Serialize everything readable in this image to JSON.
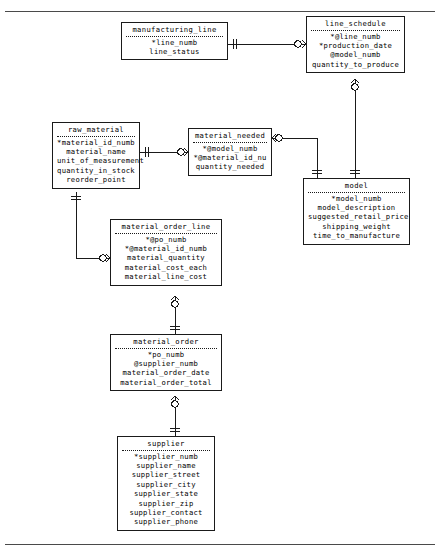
{
  "diagram": {
    "notation": "crow's foot (IE) notation",
    "legend": {
      "primary_key_marker": "*",
      "foreign_key_marker": "@"
    },
    "entities": [
      {
        "id": "manufacturing_line",
        "name": "manufacturing_line",
        "attributes": [
          "*line_numb",
          "line_status"
        ]
      },
      {
        "id": "line_schedule",
        "name": "line_schedule",
        "attributes": [
          "*@line_numb",
          "*production_date",
          "@model_numb",
          "quantity_to_produce"
        ]
      },
      {
        "id": "raw_material",
        "name": "raw_material",
        "attributes": [
          "*material_id_numb",
          "material_name",
          "unit_of_measurement",
          "quantity_in_stock",
          "reorder_point"
        ]
      },
      {
        "id": "material_needed",
        "name": "material_needed",
        "attributes": [
          "*@model_numb",
          "*@material_id_nu",
          "quantity_needed"
        ]
      },
      {
        "id": "model",
        "name": "model",
        "attributes": [
          "*model_numb",
          "model_description",
          "suggested_retail_price",
          "shipping_weight",
          "time_to_manufacture"
        ]
      },
      {
        "id": "material_order_line",
        "name": "material_order_line",
        "attributes": [
          "*@po_numb",
          "*@material_id_numb",
          "material_quantity",
          "material_cost_each",
          "material_line_cost"
        ]
      },
      {
        "id": "material_order",
        "name": "material_order",
        "attributes": [
          "*po_numb",
          "@supplier_numb",
          "material_order_date",
          "material_order_total"
        ]
      },
      {
        "id": "supplier",
        "name": "supplier",
        "attributes": [
          "*supplier_numb",
          "supplier_name",
          "supplier_street",
          "supplier_city",
          "supplier_state",
          "supplier_zip",
          "supplier_contact",
          "supplier_phone"
        ]
      }
    ],
    "relationships": [
      {
        "from": "manufacturing_line",
        "to": "line_schedule",
        "from_cardinality": "one-and-only-one",
        "to_cardinality": "zero-or-many"
      },
      {
        "from": "raw_material",
        "to": "material_needed",
        "from_cardinality": "one-and-only-one",
        "to_cardinality": "zero-or-many"
      },
      {
        "from": "model",
        "to": "material_needed",
        "from_cardinality": "one-and-only-one",
        "to_cardinality": "zero-or-many"
      },
      {
        "from": "model",
        "to": "line_schedule",
        "from_cardinality": "one-and-only-one",
        "to_cardinality": "zero-or-many"
      },
      {
        "from": "raw_material",
        "to": "material_order_line",
        "from_cardinality": "one-and-only-one",
        "to_cardinality": "zero-or-many"
      },
      {
        "from": "material_order",
        "to": "material_order_line",
        "from_cardinality": "one-and-only-one",
        "to_cardinality": "zero-or-many"
      },
      {
        "from": "supplier",
        "to": "material_order",
        "from_cardinality": "one-and-only-one",
        "to_cardinality": "zero-or-many"
      }
    ]
  },
  "colors": {
    "line": "#1a1a1a",
    "background": "#ffffff",
    "rule": "#4a4a4a"
  }
}
